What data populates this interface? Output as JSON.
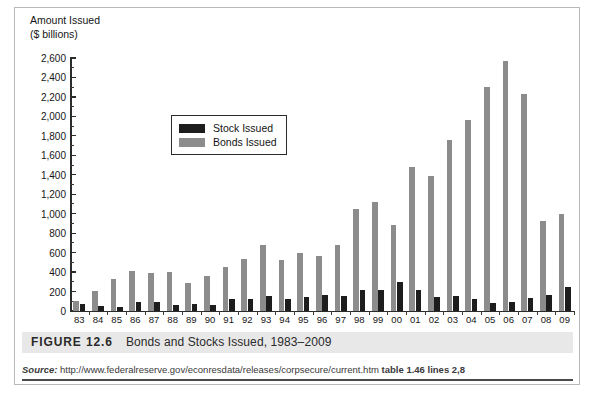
{
  "axis_title": {
    "line1": "Amount Issued",
    "line2": "($ billions)"
  },
  "legend": {
    "stock_label": "Stock Issued",
    "bonds_label": "Bonds Issued",
    "stock_color": "#1d1d1d",
    "bonds_color": "#8c8c8c"
  },
  "caption": {
    "figure_number": "FIGURE 12.6",
    "title": "Bonds and Stocks Issued, 1983–2009"
  },
  "source": {
    "label": "Source:",
    "url": "http://www.federalreserve.gov/econresdata/releases/corpsecure/current.htm",
    "table_ref": "table 1.46 lines 2,8"
  },
  "chart_data": {
    "type": "bar",
    "title": "Bonds and Stocks Issued, 1983–2009",
    "xlabel": "",
    "ylabel": "Amount Issued ($ billions)",
    "ylim": [
      0,
      2600
    ],
    "ytick_step": 200,
    "minor_tick_step": 100,
    "grid": false,
    "legend_position": "inside-upper-left",
    "categories": [
      "83",
      "84",
      "85",
      "86",
      "87",
      "88",
      "89",
      "90",
      "91",
      "92",
      "93",
      "94",
      "95",
      "96",
      "97",
      "98",
      "99",
      "00",
      "01",
      "02",
      "03",
      "04",
      "05",
      "06",
      "07",
      "08",
      "09"
    ],
    "ytick_labels": [
      "0",
      "200",
      "400",
      "600",
      "800",
      "1,000",
      "1,200",
      "1,400",
      "1,600",
      "1,800",
      "2,000",
      "2,200",
      "2,400",
      "2,600"
    ],
    "series": [
      {
        "name": "Stock Issued",
        "color": "#1d1d1d",
        "values": [
          70,
          50,
          40,
          95,
          95,
          60,
          70,
          60,
          120,
          125,
          155,
          125,
          140,
          165,
          155,
          215,
          220,
          300,
          220,
          140,
          155,
          125,
          85,
          90,
          130,
          165,
          250
        ]
      },
      {
        "name": "Bonds Issued",
        "color": "#8c8c8c",
        "values": [
          100,
          210,
          325,
          410,
          390,
          400,
          290,
          355,
          450,
          530,
          680,
          520,
          600,
          570,
          680,
          1050,
          1120,
          880,
          1480,
          1390,
          1760,
          1960,
          2300,
          2570,
          2230,
          930,
          1000
        ]
      }
    ]
  }
}
